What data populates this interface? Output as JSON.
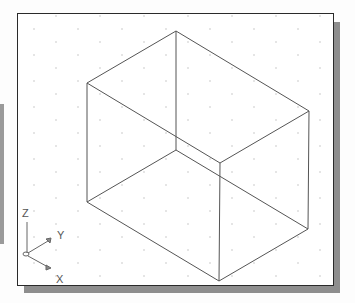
{
  "viewport": {
    "background": "#ffffff",
    "border_color": "#2a2a2a",
    "grid": {
      "visible": true,
      "style": "isometric-dots",
      "dot_color": "#c8c8c8"
    }
  },
  "model": {
    "type": "isometric-box-wireframe",
    "edge_color": "#555555",
    "vertices": {
      "top": [
        176,
        31
      ],
      "left_top": [
        87,
        83
      ],
      "left_bottom": [
        87,
        202
      ],
      "inner": [
        176,
        150
      ],
      "front_top": [
        220,
        163
      ],
      "right_top": [
        309,
        111
      ],
      "right_bottom": [
        308,
        229
      ],
      "front_bottom": [
        219,
        281
      ]
    }
  },
  "ucs_icon": {
    "axis_z_label": "Z",
    "axis_y_label": "Y",
    "axis_x_label": "X",
    "color": "#666666"
  }
}
